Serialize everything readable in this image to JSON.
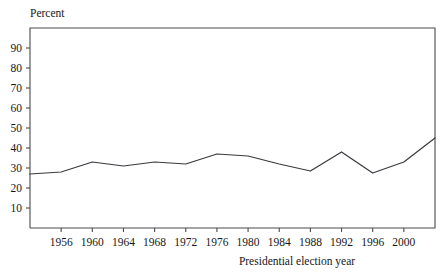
{
  "chart_data": {
    "type": "line",
    "title": "",
    "ylabel": "Percent",
    "xlabel": "Presidential election year",
    "ylim": [
      0,
      100
    ],
    "xlim": [
      1952,
      2004
    ],
    "grid": false,
    "legend": null,
    "yticks": [
      10,
      20,
      30,
      40,
      50,
      60,
      70,
      80,
      90
    ],
    "ytick_labels": [
      "10",
      "20",
      "30",
      "40",
      "50",
      "60",
      "70",
      "80",
      "90"
    ],
    "xticks": [
      1956,
      1960,
      1964,
      1968,
      1972,
      1976,
      1980,
      1984,
      1988,
      1992,
      1996,
      2000
    ],
    "xtick_labels": [
      "1956",
      "1960",
      "1964",
      "1968",
      "1972",
      "1976",
      "1980",
      "1984",
      "1988",
      "1992",
      "1996",
      "2000"
    ],
    "series": [
      {
        "name": "Percent",
        "color": "#3a3a40",
        "x": [
          1952,
          1956,
          1960,
          1964,
          1968,
          1972,
          1976,
          1980,
          1984,
          1988,
          1992,
          1996,
          2000,
          2004
        ],
        "values": [
          27,
          28,
          33,
          31,
          33,
          32,
          37,
          36,
          32,
          28.5,
          38,
          27.5,
          33,
          45
        ]
      }
    ]
  },
  "axis": {
    "y_title": "Percent",
    "x_title": "Presidential election year"
  }
}
